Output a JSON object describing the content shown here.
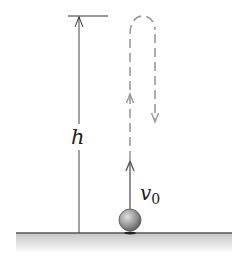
{
  "diagram": {
    "title": "",
    "labels": {
      "height": "h",
      "velocity_symbol": "v",
      "velocity_subscript": "0"
    },
    "colors": {
      "line": "#444444",
      "dashed_path": "#9a9a9a",
      "ground_line": "#555555",
      "ground_fill_top": "#c8c8c8",
      "ball": "#8a8a8a"
    },
    "elements": [
      {
        "name": "height-dimension-arrow",
        "label": "h"
      },
      {
        "name": "initial-velocity-arrow",
        "label": "v0"
      },
      {
        "name": "upward-dashed-path"
      },
      {
        "name": "downward-dashed-path"
      },
      {
        "name": "ball"
      },
      {
        "name": "ground"
      }
    ]
  }
}
